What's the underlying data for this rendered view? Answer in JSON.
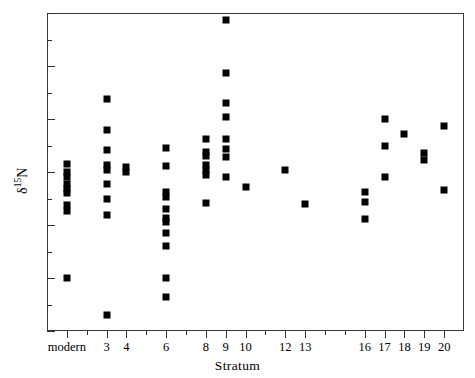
{
  "chart_data": {
    "type": "scatter",
    "title": "",
    "xlabel": "Stratum",
    "ylabel": "δ15N",
    "ylabel_parts": {
      "delta": "δ",
      "superscript": "15",
      "element": "N"
    },
    "xlim": [
      0,
      21
    ],
    "ylim": [
      -2,
      4
    ],
    "y_ticks": [
      -2,
      -1,
      0,
      1,
      2,
      3,
      4
    ],
    "y_tick_labels": [
      "−2",
      "−1",
      "0",
      "1",
      "2",
      "3",
      "4"
    ],
    "y_minor_ticks": [
      -1.5,
      -0.5,
      0.5,
      1.5,
      2.5,
      3.5
    ],
    "x_ticks": [
      1,
      2,
      3,
      4,
      5,
      6,
      7,
      8,
      9,
      10,
      11,
      12,
      13,
      14,
      15,
      16,
      17,
      18,
      19,
      20
    ],
    "x_tick_labels": [
      {
        "x": 1,
        "label": "modern",
        "major": true
      },
      {
        "x": 2,
        "label": "",
        "major": false
      },
      {
        "x": 3,
        "label": "3",
        "major": true
      },
      {
        "x": 4,
        "label": "4",
        "major": true
      },
      {
        "x": 5,
        "label": "",
        "major": false
      },
      {
        "x": 6,
        "label": "6",
        "major": true
      },
      {
        "x": 7,
        "label": "",
        "major": false
      },
      {
        "x": 8,
        "label": "8",
        "major": true
      },
      {
        "x": 9,
        "label": "9",
        "major": true
      },
      {
        "x": 10,
        "label": "10",
        "major": true
      },
      {
        "x": 11,
        "label": "",
        "major": false
      },
      {
        "x": 12,
        "label": "12",
        "major": true
      },
      {
        "x": 13,
        "label": "13",
        "major": true
      },
      {
        "x": 14,
        "label": "",
        "major": false
      },
      {
        "x": 15,
        "label": "",
        "major": false
      },
      {
        "x": 16,
        "label": "16",
        "major": true
      },
      {
        "x": 17,
        "label": "17",
        "major": true
      },
      {
        "x": 18,
        "label": "18",
        "major": true
      },
      {
        "x": 19,
        "label": "19",
        "major": true
      },
      {
        "x": 20,
        "label": "20",
        "major": true
      }
    ],
    "grid": false,
    "legend": null,
    "marker": {
      "shape": "square",
      "color": "#000000",
      "size_px": 7
    },
    "series": [
      {
        "name": "δ15N by stratum",
        "points": [
          {
            "x": 1,
            "y": 1.15
          },
          {
            "x": 1,
            "y": 1.0
          },
          {
            "x": 1,
            "y": 0.9
          },
          {
            "x": 1,
            "y": 0.78
          },
          {
            "x": 1,
            "y": 0.68
          },
          {
            "x": 1,
            "y": 0.6
          },
          {
            "x": 1,
            "y": 0.38
          },
          {
            "x": 1,
            "y": 0.26
          },
          {
            "x": 1,
            "y": -1.0
          },
          {
            "x": 3,
            "y": 2.38
          },
          {
            "x": 3,
            "y": 1.8
          },
          {
            "x": 3,
            "y": 1.42
          },
          {
            "x": 3,
            "y": 1.14
          },
          {
            "x": 3,
            "y": 1.04
          },
          {
            "x": 3,
            "y": 0.78
          },
          {
            "x": 3,
            "y": 0.5
          },
          {
            "x": 3,
            "y": 0.18
          },
          {
            "x": 3,
            "y": -1.7
          },
          {
            "x": 4,
            "y": 1.1
          },
          {
            "x": 4,
            "y": 1.0
          },
          {
            "x": 6,
            "y": 1.46
          },
          {
            "x": 6,
            "y": 1.12
          },
          {
            "x": 6,
            "y": 0.62
          },
          {
            "x": 6,
            "y": 0.52
          },
          {
            "x": 6,
            "y": 0.3
          },
          {
            "x": 6,
            "y": 0.14
          },
          {
            "x": 6,
            "y": 0.06
          },
          {
            "x": 6,
            "y": -0.16
          },
          {
            "x": 6,
            "y": -0.4
          },
          {
            "x": 6,
            "y": -1.0
          },
          {
            "x": 6,
            "y": -1.35
          },
          {
            "x": 8,
            "y": 1.62
          },
          {
            "x": 8,
            "y": 1.38
          },
          {
            "x": 8,
            "y": 1.3
          },
          {
            "x": 8,
            "y": 1.14
          },
          {
            "x": 8,
            "y": 1.04
          },
          {
            "x": 8,
            "y": 0.94
          },
          {
            "x": 8,
            "y": 0.42
          },
          {
            "x": 9,
            "y": 3.86
          },
          {
            "x": 9,
            "y": 2.86
          },
          {
            "x": 9,
            "y": 2.3
          },
          {
            "x": 9,
            "y": 2.04
          },
          {
            "x": 9,
            "y": 1.62
          },
          {
            "x": 9,
            "y": 1.44
          },
          {
            "x": 9,
            "y": 1.28
          },
          {
            "x": 9,
            "y": 0.9
          },
          {
            "x": 10,
            "y": 0.72
          },
          {
            "x": 12,
            "y": 1.03
          },
          {
            "x": 13,
            "y": 0.4
          },
          {
            "x": 16,
            "y": 0.62
          },
          {
            "x": 16,
            "y": 0.44
          },
          {
            "x": 16,
            "y": 0.12
          },
          {
            "x": 17,
            "y": 2.0
          },
          {
            "x": 17,
            "y": 1.5
          },
          {
            "x": 17,
            "y": 0.9
          },
          {
            "x": 18,
            "y": 1.72
          },
          {
            "x": 19,
            "y": 1.36
          },
          {
            "x": 19,
            "y": 1.22
          },
          {
            "x": 20,
            "y": 1.86
          },
          {
            "x": 20,
            "y": 0.66
          }
        ]
      }
    ]
  }
}
